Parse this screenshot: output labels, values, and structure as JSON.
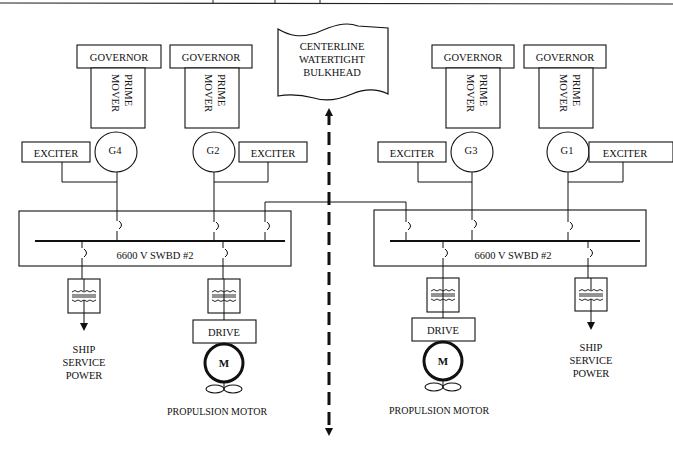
{
  "bulkhead": {
    "lines": [
      "CENTERLINE",
      "WATERTIGHT",
      "BULKHEAD"
    ]
  },
  "generators": [
    {
      "id": "G4",
      "governor": "GOVERNOR",
      "prime_mover": [
        "PRIME",
        "MOVER"
      ],
      "exciter": "EXCITER"
    },
    {
      "id": "G2",
      "governor": "GOVERNOR",
      "prime_mover": [
        "PRIME",
        "MOVER"
      ],
      "exciter": "EXCITER"
    },
    {
      "id": "G3",
      "governor": "GOVERNOR",
      "prime_mover": [
        "PRIME",
        "MOVER"
      ],
      "exciter": "EXCITER"
    },
    {
      "id": "G1",
      "governor": "GOVERNOR",
      "prime_mover": [
        "PRIME",
        "MOVER"
      ],
      "exciter": "EXCITER"
    }
  ],
  "switchboards": [
    {
      "label": "6600 V SWBD #2"
    },
    {
      "label": "6600 V SWBD #2"
    }
  ],
  "loads": {
    "left_ship_service": [
      "SHIP",
      "SERVICE",
      "POWER"
    ],
    "right_ship_service": [
      "SHIP",
      "SERVICE",
      "POWER"
    ],
    "left_drive": "DRIVE",
    "right_drive": "DRIVE",
    "motor_symbol": "M",
    "left_propulsion": "PROPULSION MOTOR",
    "right_propulsion": "PROPULSION MOTOR"
  },
  "colors": {
    "line": "#111111",
    "background": "#ffffff"
  }
}
